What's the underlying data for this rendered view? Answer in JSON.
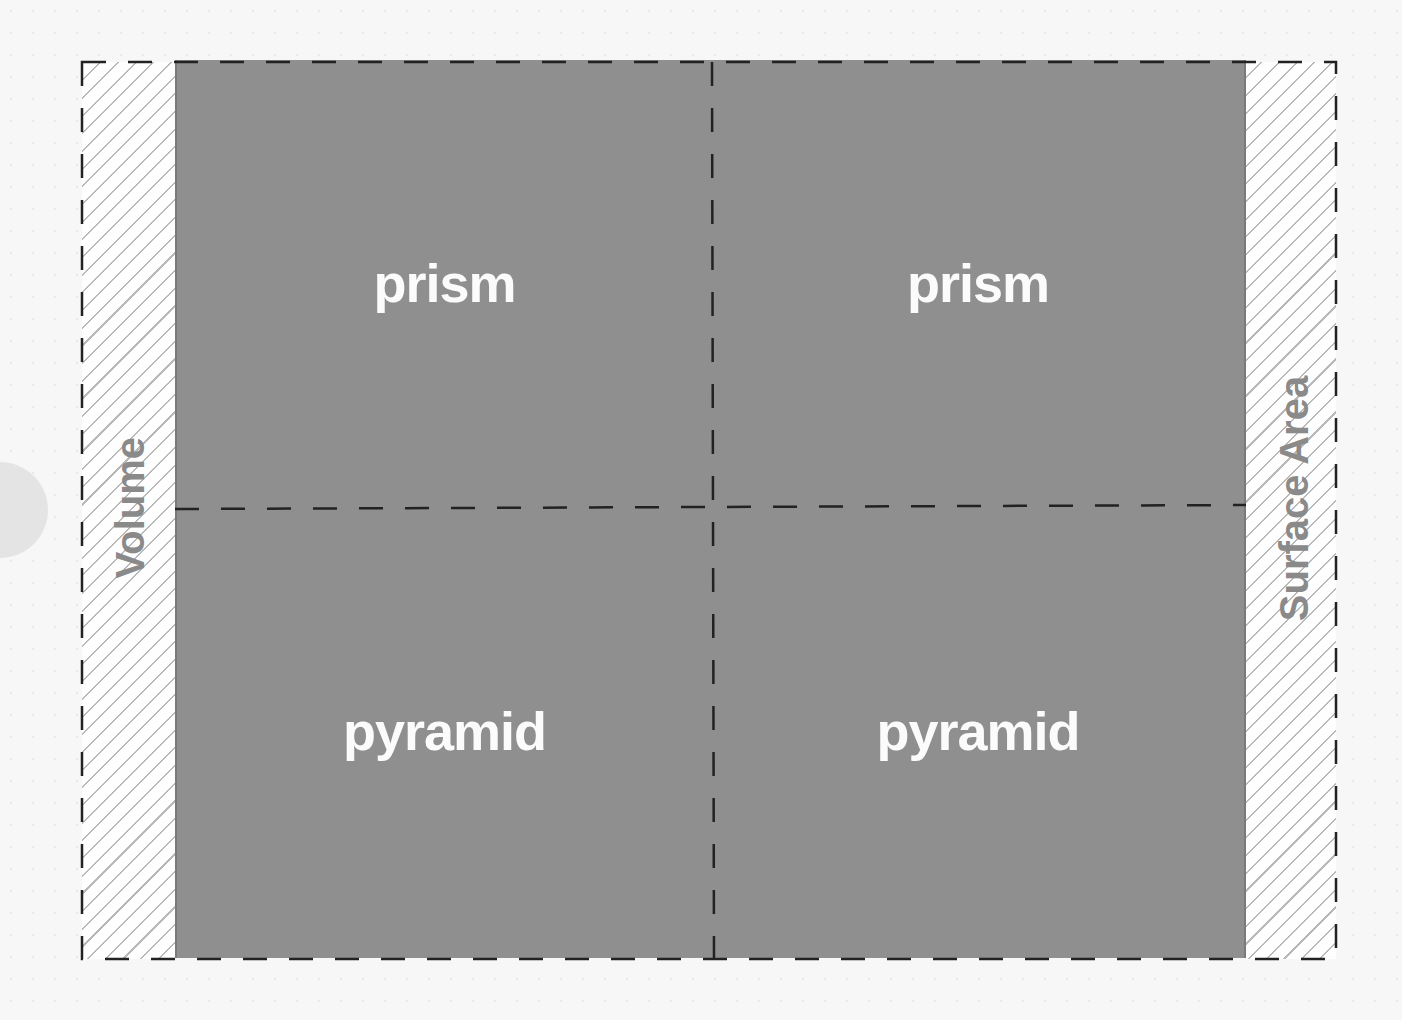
{
  "diagram": {
    "type": "2x2 grid",
    "axes": {
      "left_label": "Volume",
      "right_label": "Surface Area"
    },
    "quadrants": [
      {
        "position": "top-left",
        "label": "prism"
      },
      {
        "position": "top-right",
        "label": "prism"
      },
      {
        "position": "bottom-left",
        "label": "pyramid"
      },
      {
        "position": "bottom-right",
        "label": "pyramid"
      }
    ],
    "colors": {
      "panel": "#8f8f8f",
      "quadrant_text": "#fbfbfb",
      "axis_label": "#8a8a8a",
      "dash": "#222222",
      "hatch": "#b9b9b9"
    }
  }
}
